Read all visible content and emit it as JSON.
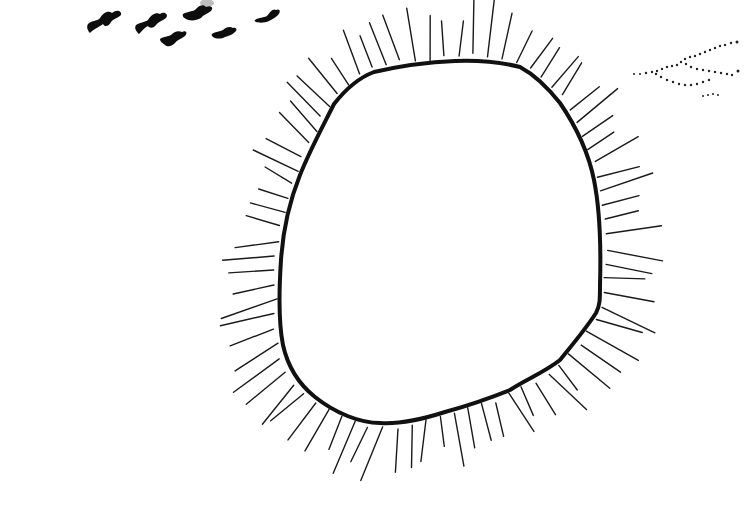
{
  "scene": {
    "title": "Hand-drawn sketch: rayed circle with birds",
    "background": "#ffffff",
    "ink": "#111111",
    "elements": [
      {
        "name": "rayed-circle",
        "description": "Irregular rounded loop with short radiating strokes"
      },
      {
        "name": "bird-flock",
        "count": 6
      },
      {
        "name": "dotted-trail",
        "description": "Branching dotted lines at top-right edge"
      }
    ]
  }
}
